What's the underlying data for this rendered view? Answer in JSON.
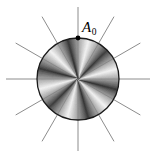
{
  "figure": {
    "kind": "shaded-disk-with-radial-spokes",
    "background_color": "#ffffff",
    "canvas": {
      "width": 155,
      "height": 164
    },
    "disk": {
      "center_x": 78,
      "center_y": 79,
      "radius": 41,
      "outline_color": "#1a1a1a",
      "outline_width": 1.3,
      "sector_count": 12,
      "sector_angle_degrees": 30,
      "shading": "conic sawtooth, each sector ramps dark to light",
      "shade_dark": "#2b2b2b",
      "shade_light": "#f2f2f2"
    },
    "spokes": {
      "count": 12,
      "diameter_lines": 6,
      "angle_step_degrees": 30,
      "inner_radius": 0,
      "outer_radius": 72,
      "color": "#6e6e6e",
      "width": 0.8
    },
    "marker": {
      "label": "A",
      "subscript": "0",
      "angle_degrees": 90,
      "dot_color": "#000000",
      "dot_radius": 2.4,
      "label_x": 82,
      "label_y": 20
    }
  }
}
